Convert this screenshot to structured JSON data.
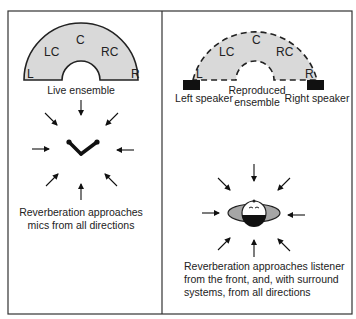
{
  "left_panel": {
    "title": "Live ensemble",
    "positions": [
      "L",
      "LC",
      "C",
      "RC",
      "R"
    ],
    "caption_lines": [
      "Reverberation approaches",
      "mics from all directions"
    ]
  },
  "right_panel": {
    "positions": [
      "L",
      "LC",
      "C",
      "RC",
      "R"
    ],
    "ensemble_label_lines": [
      "Reproduced",
      "ensemble"
    ],
    "left_speaker": "Left speaker",
    "right_speaker": "Right speaker",
    "caption_lines": [
      "Reverberation approaches listener",
      "from the front, and, with surround",
      "systems, from all directions"
    ]
  },
  "colors": {
    "ensemble_fill": "#d9d9d9",
    "outline": "#222222",
    "speaker": "#111111",
    "listener_shoulders": "#a6a6a6"
  }
}
